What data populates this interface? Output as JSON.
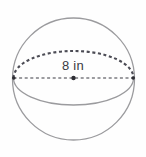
{
  "figure": {
    "name": "sphere-diagram",
    "background_color": "#fefefe",
    "canvas": {
      "width": 146,
      "height": 157
    }
  },
  "labels": {
    "diameter": "8 in",
    "diameter_value": 8,
    "diameter_unit": "in"
  },
  "geometry": {
    "sphere_outline": {
      "icon": "circle-outline-icon",
      "center_x": 73.5,
      "center_y": 79,
      "radius": 61,
      "stroke_color": "#9b9b9e",
      "stroke_width": 1.3,
      "style": "solid"
    },
    "equator_back_arc": {
      "icon": "dashed-arc-icon",
      "center_x": 73.5,
      "center_y": 78,
      "rx": 60,
      "ry": 27,
      "stroke_color": "#4c4c55",
      "stroke_width": 2.1,
      "style": "dashed",
      "dash_pattern": "3 2.6",
      "half": "upper"
    },
    "equator_front_arc": {
      "icon": "solid-arc-icon",
      "center_x": 73.5,
      "center_y": 78,
      "rx": 60,
      "ry": 27,
      "stroke_color": "#9b9b9e",
      "stroke_width": 1.3,
      "style": "solid",
      "half": "lower"
    },
    "diameter_line": {
      "icon": "dashed-line-icon",
      "x1": 13.5,
      "y1": 78,
      "x2": 133.5,
      "y2": 78,
      "stroke_color": "#3b3b42",
      "stroke_width": 1.2,
      "style": "dashed",
      "dash_pattern": "3 2.6"
    },
    "center_point": {
      "icon": "center-dot-icon",
      "cx": 73.5,
      "cy": 78,
      "r": 2.2,
      "fill_color": "#2e2e34"
    },
    "left_endpoint": {
      "icon": "endpoint-dot-icon",
      "cx": 13.8,
      "cy": 78,
      "r": 1.8,
      "fill_color": "#2e2e34"
    },
    "right_endpoint": {
      "icon": "endpoint-dot-icon",
      "cx": 133.2,
      "cy": 78,
      "r": 1.8,
      "fill_color": "#2e2e34"
    }
  },
  "colors": {
    "outline_gray": "#9b9b9e",
    "dash_dark": "#4c4c55",
    "text_dark": "#3b3b42",
    "dot_black": "#2e2e34",
    "background": "#fefefe"
  }
}
